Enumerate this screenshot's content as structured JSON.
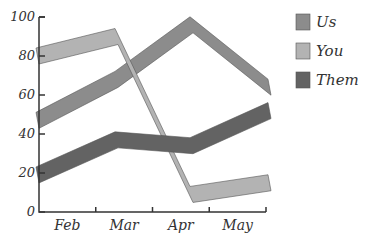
{
  "chart_data": {
    "type": "line",
    "title": "",
    "xlabel": "",
    "ylabel": "",
    "categories": [
      "Feb",
      "Mar",
      "Apr",
      "May"
    ],
    "series": [
      {
        "name": "Us",
        "values": [
          47,
          68,
          96,
          64
        ],
        "color": "#8c8c8c"
      },
      {
        "name": "You",
        "values": [
          80,
          90,
          9,
          15
        ],
        "color": "#b3b3b3"
      },
      {
        "name": "Them",
        "values": [
          19,
          37,
          34,
          52
        ],
        "color": "#636363"
      }
    ],
    "ylim": [
      0,
      100
    ],
    "yticks": [
      0,
      20,
      40,
      60,
      80,
      100
    ],
    "grid": false,
    "legend_position": "right",
    "style": "ribbon"
  }
}
